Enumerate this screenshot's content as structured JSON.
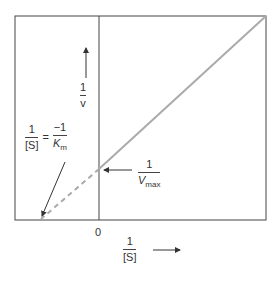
{
  "y_axis_label": {
    "num": "1",
    "den": "v"
  },
  "x_axis_label": {
    "num": "1",
    "den": "[S]"
  },
  "origin_label": "0",
  "x_intercept_label": {
    "lhs_num": "1",
    "lhs_den": "[S]",
    "equals": "=",
    "rhs_num": "−1",
    "rhs_den_main": "K",
    "rhs_den_sub": "m"
  },
  "y_intercept_label": {
    "num": "1",
    "den_main": "V",
    "den_sub": "max"
  },
  "colors": {
    "frame": "#444444",
    "line": "#aaaaaa"
  }
}
